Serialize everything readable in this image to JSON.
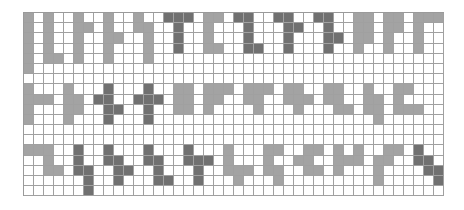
{
  "grid": {
    "columns": 42,
    "rows": 18,
    "colors": {
      "empty": "#ffffff",
      "gray": "#a3a3a3",
      "dark": "#707070",
      "line": "#a0a0a0"
    },
    "cells": [
      {
        "row": 0,
        "gray": [
          0,
          2,
          5,
          8,
          11,
          18,
          19,
          33,
          34,
          36,
          37,
          39,
          40,
          41
        ],
        "dark": [
          14,
          15,
          16,
          21,
          22,
          25,
          26,
          29,
          30
        ]
      },
      {
        "row": 1,
        "gray": [
          0,
          2,
          5,
          6,
          8,
          11,
          12,
          18,
          33,
          34,
          36,
          37,
          39
        ],
        "dark": [
          15,
          22,
          26,
          27,
          30
        ]
      },
      {
        "row": 2,
        "gray": [
          0,
          2,
          5,
          8,
          9,
          12,
          18,
          33,
          34,
          36,
          39
        ],
        "dark": [
          15,
          22,
          26,
          30,
          31
        ]
      },
      {
        "row": 3,
        "gray": [
          0,
          2,
          5,
          8,
          12,
          18,
          19,
          33,
          36,
          39
        ],
        "dark": [
          15,
          22,
          23,
          26,
          30
        ]
      },
      {
        "row": 4,
        "gray": [
          0,
          2,
          3,
          5,
          8,
          12
        ],
        "dark": []
      },
      {
        "row": 5,
        "gray": [
          0
        ],
        "dark": []
      },
      {
        "row": 6,
        "gray": [],
        "dark": []
      },
      {
        "row": 7,
        "gray": [
          0,
          4,
          15,
          16,
          18,
          19,
          20,
          22,
          23,
          24,
          26,
          27,
          30,
          31,
          34,
          37,
          38
        ],
        "dark": [
          8,
          12
        ]
      },
      {
        "row": 8,
        "gray": [
          0,
          1,
          2,
          4,
          5,
          15,
          16,
          18,
          19,
          22,
          23,
          26,
          27,
          28,
          30,
          31,
          34,
          35,
          37
        ],
        "dark": [
          7,
          8,
          11,
          12,
          13
        ]
      },
      {
        "row": 9,
        "gray": [
          0,
          4,
          5,
          15,
          16,
          18,
          23,
          27,
          31,
          32,
          34,
          35,
          37,
          38,
          39
        ],
        "dark": [
          8,
          9,
          12
        ]
      },
      {
        "row": 10,
        "gray": [
          0,
          4,
          35
        ],
        "dark": [
          8,
          12
        ]
      },
      {
        "row": 11,
        "gray": [],
        "dark": []
      },
      {
        "row": 12,
        "gray": [],
        "dark": []
      },
      {
        "row": 13,
        "gray": [
          0,
          1,
          2,
          20,
          24,
          25,
          28,
          29,
          31,
          33,
          36,
          37
        ],
        "dark": [
          5,
          8,
          12,
          16,
          39
        ]
      },
      {
        "row": 14,
        "gray": [
          2,
          20,
          24,
          27,
          28,
          31,
          32,
          33,
          35,
          36
        ],
        "dark": [
          5,
          8,
          9,
          12,
          13,
          16,
          17,
          18,
          39,
          40
        ]
      },
      {
        "row": 15,
        "gray": [
          2,
          3,
          20,
          21,
          22,
          24,
          25,
          28,
          29,
          31,
          35
        ],
        "dark": [
          5,
          6,
          9,
          10,
          13,
          17,
          40,
          41
        ]
      },
      {
        "row": 16,
        "gray": [
          21,
          25,
          35
        ],
        "dark": [
          6,
          9,
          13,
          14,
          17,
          41
        ]
      },
      {
        "row": 17,
        "gray": [],
        "dark": [
          6
        ]
      }
    ]
  }
}
